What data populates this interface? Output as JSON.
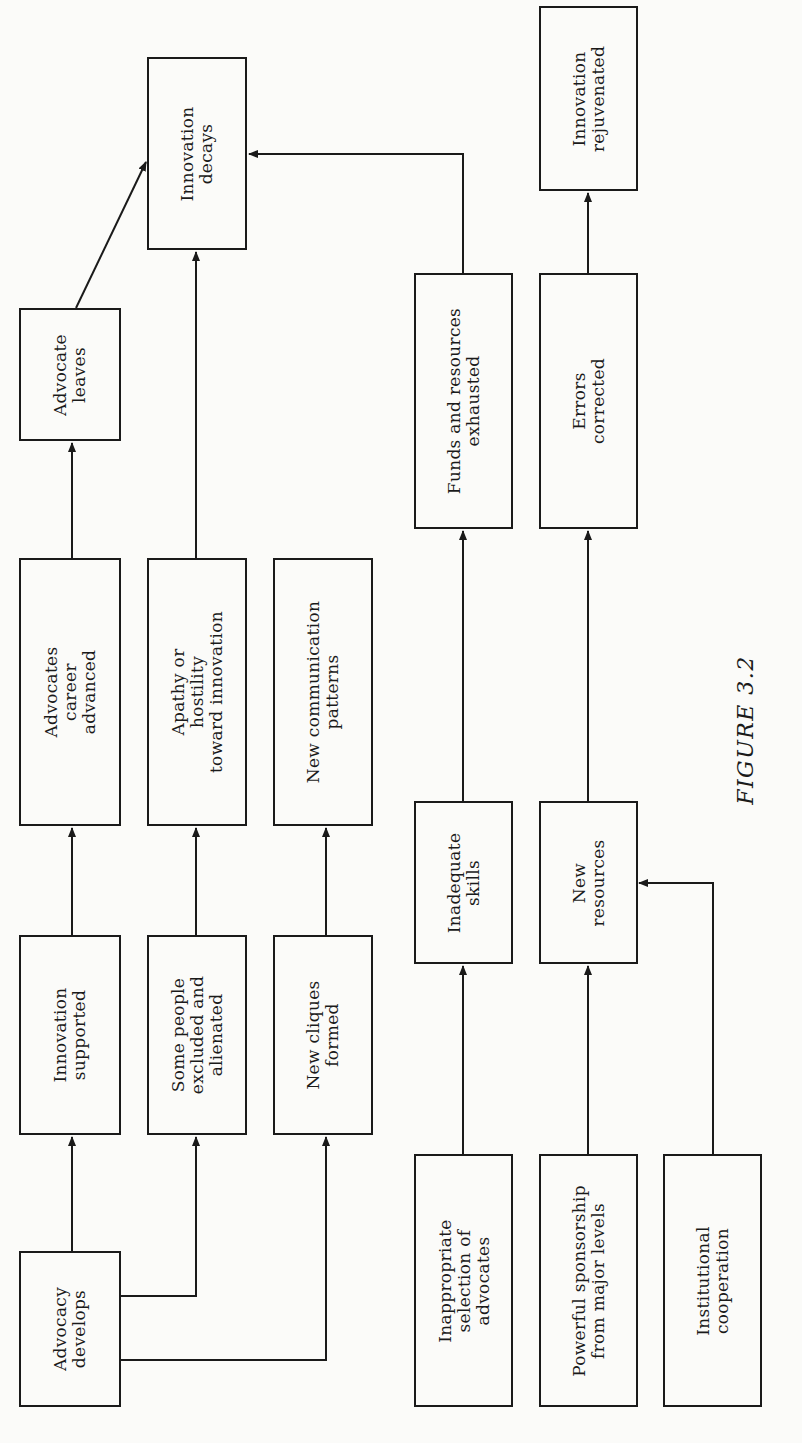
{
  "figure": {
    "caption": "FIGURE 3.2",
    "orientation": "rotated 90° counter-clockwise",
    "nodes": [
      {
        "id": "advocacy_develops",
        "label": "Advocacy\ndevelops"
      },
      {
        "id": "innovation_supported",
        "label": "Innovation\nsupported"
      },
      {
        "id": "advocates_career_advanced",
        "label": "Advocates\ncareer\nadvanced"
      },
      {
        "id": "advocate_leaves",
        "label": "Advocate\nleaves"
      },
      {
        "id": "innovation_decays",
        "label": "Innovation\ndecays"
      },
      {
        "id": "some_people_excluded",
        "label": "Some people\nexcluded and\nalienated"
      },
      {
        "id": "apathy_hostility",
        "label": "Apathy or\nhostility\ntoward innovation"
      },
      {
        "id": "new_cliques_formed",
        "label": "New cliques\nformed"
      },
      {
        "id": "new_communication_patterns",
        "label": "New communication\npatterns"
      },
      {
        "id": "inappropriate_selection",
        "label": "Inappropriate\nselection of\nadvocates"
      },
      {
        "id": "inadequate_skills",
        "label": "Inadequate\nskills"
      },
      {
        "id": "funds_exhausted",
        "label": "Funds and resources\nexhausted"
      },
      {
        "id": "powerful_sponsorship",
        "label": "Powerful sponsorship\nfrom major levels"
      },
      {
        "id": "new_resources",
        "label": "New\nresources"
      },
      {
        "id": "errors_corrected",
        "label": "Errors\ncorrected"
      },
      {
        "id": "innovation_rejuvenated",
        "label": "Innovation\nrejuvenated"
      },
      {
        "id": "institutional_cooperation",
        "label": "Institutional\ncooperation"
      }
    ],
    "edges": [
      {
        "from": "advocacy_develops",
        "to": "innovation_supported"
      },
      {
        "from": "advocacy_develops",
        "to": "some_people_excluded"
      },
      {
        "from": "advocacy_develops",
        "to": "new_cliques_formed"
      },
      {
        "from": "innovation_supported",
        "to": "advocates_career_advanced"
      },
      {
        "from": "advocates_career_advanced",
        "to": "advocate_leaves"
      },
      {
        "from": "advocate_leaves",
        "to": "innovation_decays"
      },
      {
        "from": "some_people_excluded",
        "to": "apathy_hostility"
      },
      {
        "from": "apathy_hostility",
        "to": "innovation_decays"
      },
      {
        "from": "new_cliques_formed",
        "to": "new_communication_patterns"
      },
      {
        "from": "inappropriate_selection",
        "to": "inadequate_skills"
      },
      {
        "from": "inadequate_skills",
        "to": "funds_exhausted"
      },
      {
        "from": "funds_exhausted",
        "to": "innovation_decays"
      },
      {
        "from": "powerful_sponsorship",
        "to": "new_resources"
      },
      {
        "from": "institutional_cooperation",
        "to": "new_resources"
      },
      {
        "from": "new_resources",
        "to": "errors_corrected"
      },
      {
        "from": "errors_corrected",
        "to": "innovation_rejuvenated"
      }
    ]
  }
}
